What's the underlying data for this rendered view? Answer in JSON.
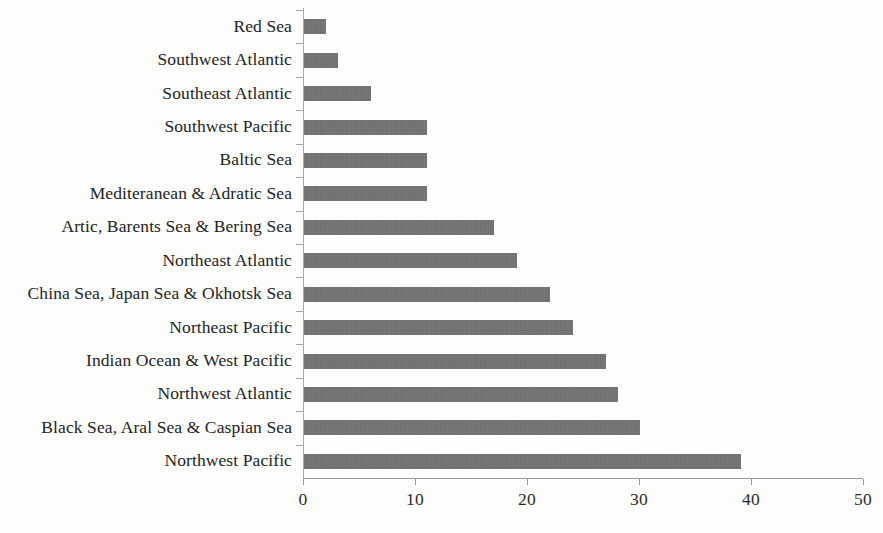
{
  "chart_data": {
    "type": "bar",
    "orientation": "horizontal",
    "title": "",
    "subtitle": "",
    "xlabel": "",
    "ylabel": "",
    "xlim": [
      0,
      50
    ],
    "xticks": [
      "0",
      "10",
      "20",
      "30",
      "40",
      "50"
    ],
    "xtick_values": [
      0,
      10,
      20,
      30,
      40,
      50
    ],
    "grid": false,
    "legend": false,
    "legend_position": "none",
    "bar_color": "#6e6e6e",
    "axis_color": "#9a9a96",
    "text_color": "#242424",
    "categories": [
      "Red Sea",
      "Southwest Atlantic",
      "Southeast Atlantic",
      "Southwest Pacific",
      "Baltic Sea",
      "Mediteranean & Adratic Sea",
      "Artic, Barents Sea & Bering Sea",
      "Northeast Atlantic",
      "China Sea, Japan Sea & Okhotsk Sea",
      "Northeast Pacific",
      "Indian Ocean & West Pacific",
      "Northwest Atlantic",
      "Black Sea, Aral Sea & Caspian Sea",
      "Northwest Pacific"
    ],
    "values": [
      2,
      3,
      6,
      11,
      11,
      11,
      17,
      19,
      22,
      24,
      27,
      28,
      30,
      39
    ]
  }
}
